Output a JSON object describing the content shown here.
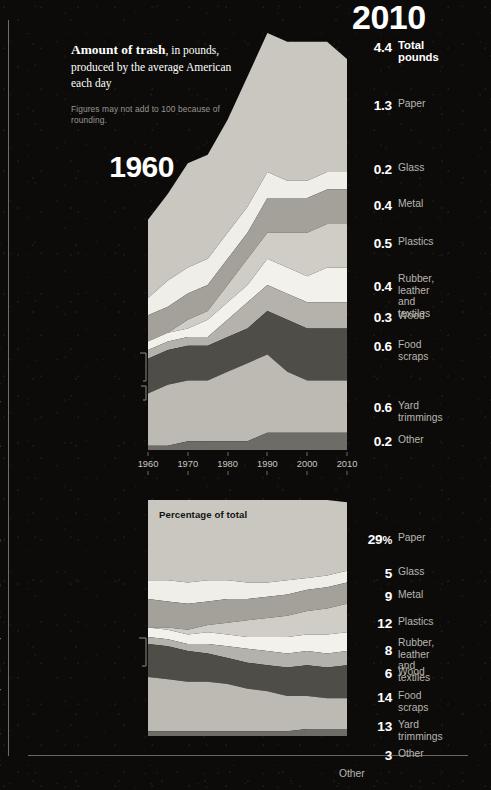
{
  "headline": {
    "bold": "Amount of trash",
    "rest": ", in pounds, produced by the average American each day",
    "note": "Figures may not add to 100 because of rounding."
  },
  "left_title": "1960",
  "right_title": "2010",
  "pct_chart_title": "Percentage of total",
  "footer_label": "Other",
  "colors": {
    "paper": "#c9c7c0",
    "glass": "#efeee8",
    "metal": "#a3a199",
    "plastics": "#cfcdc6",
    "rubber": "#f2f1eb",
    "wood": "#b4b2aa",
    "food_scraps": "#4f4d48",
    "yard_trimmings": "#bcbab2",
    "other": "#6e6c66",
    "background": "#0c0b0a",
    "text_primary": "#ffffff",
    "text_secondary": "#b9b5af"
  },
  "axis": {
    "ticks": [
      "1960",
      "1970",
      "1980",
      "1990",
      "2000",
      "2010"
    ],
    "min": 1960,
    "max": 2010
  },
  "pounds_1960": {
    "header_label": "Total pounds",
    "header_value": "2.7",
    "rows": [
      {
        "label": "Paper",
        "value": "0.9"
      },
      {
        "label": "Glass",
        "value": "0.2"
      },
      {
        "label": "Metal",
        "value": "0.3"
      },
      {
        "label": "Rubber, leather\nand textiles",
        "value": "0.1"
      },
      {
        "label": "Wood",
        "value": "0.1"
      },
      {
        "label": "Food scraps",
        "value": "0.4"
      },
      {
        "label": "Yard trimmings",
        "value": "0.6"
      },
      {
        "label": "Other",
        "value": "<0.1"
      }
    ]
  },
  "pounds_2010": {
    "header_label": "Total pounds",
    "header_value": "4.4",
    "rows": [
      {
        "label": "Paper",
        "value": "1.3"
      },
      {
        "label": "Glass",
        "value": "0.2"
      },
      {
        "label": "Metal",
        "value": "0.4"
      },
      {
        "label": "Plastics",
        "value": "0.5"
      },
      {
        "label": "Rubber, leather\nand textiles",
        "value": "0.4"
      },
      {
        "label": "Wood",
        "value": "0.3"
      },
      {
        "label": "Food scraps",
        "value": "0.6"
      },
      {
        "label": "Yard trimmings",
        "value": "0.6"
      },
      {
        "label": "Other",
        "value": "0.2"
      }
    ]
  },
  "percent_1960": {
    "rows": [
      {
        "label": "Paper",
        "value": "34",
        "unit": "%"
      },
      {
        "label": "Glass",
        "value": "8",
        "unit": ""
      },
      {
        "label": "Metal",
        "value": "12",
        "unit": ""
      },
      {
        "label": "Rubber, leather\nand textiles",
        "value": "4",
        "unit": ""
      },
      {
        "label": "Wood",
        "value": "3",
        "unit": ""
      },
      {
        "label": "Food scraps",
        "value": "14",
        "unit": ""
      },
      {
        "label": "Yard trimmings",
        "value": "23",
        "unit": ""
      },
      {
        "label": "Other",
        "value": "2",
        "unit": ""
      }
    ]
  },
  "percent_2010": {
    "rows": [
      {
        "label": "Paper",
        "value": "29",
        "unit": "%"
      },
      {
        "label": "Glass",
        "value": "5",
        "unit": ""
      },
      {
        "label": "Metal",
        "value": "9",
        "unit": ""
      },
      {
        "label": "Plastics",
        "value": "12",
        "unit": ""
      },
      {
        "label": "Rubber, leather\nand textiles",
        "value": "8",
        "unit": ""
      },
      {
        "label": "Wood",
        "value": "6",
        "unit": ""
      },
      {
        "label": "Food scraps",
        "value": "14",
        "unit": ""
      },
      {
        "label": "Yard trimmings",
        "value": "13",
        "unit": ""
      },
      {
        "label": "Other",
        "value": "3",
        "unit": ""
      }
    ]
  },
  "chart_data": [
    {
      "type": "area",
      "id": "pounds-stacked-area",
      "title": "Amount of trash, in pounds, produced by the average American each day",
      "xlabel": "",
      "ylabel": "pounds per person per day",
      "x": [
        1960,
        1965,
        1970,
        1975,
        1980,
        1985,
        1990,
        1995,
        2000,
        2005,
        2010
      ],
      "xlim": [
        1960,
        2010
      ],
      "ylim": [
        0,
        4.8
      ],
      "grid": false,
      "legend": "outside-left-and-right",
      "stacked": true,
      "series": [
        {
          "name": "Paper",
          "color": "#c9c7c0",
          "values": [
            0.9,
            1.0,
            1.2,
            1.2,
            1.3,
            1.5,
            1.6,
            1.6,
            1.6,
            1.5,
            1.3
          ]
        },
        {
          "name": "Glass",
          "color": "#efeee8",
          "values": [
            0.2,
            0.3,
            0.3,
            0.3,
            0.3,
            0.3,
            0.3,
            0.2,
            0.2,
            0.2,
            0.2
          ]
        },
        {
          "name": "Metal",
          "color": "#a3a199",
          "values": [
            0.3,
            0.3,
            0.3,
            0.3,
            0.3,
            0.3,
            0.4,
            0.4,
            0.4,
            0.4,
            0.4
          ]
        },
        {
          "name": "Plastics",
          "color": "#cfcdc6",
          "values": [
            0.0,
            0.0,
            0.1,
            0.1,
            0.2,
            0.3,
            0.3,
            0.4,
            0.5,
            0.5,
            0.5
          ]
        },
        {
          "name": "Rubber, leather and textiles",
          "color": "#f2f1eb",
          "values": [
            0.1,
            0.1,
            0.1,
            0.2,
            0.2,
            0.2,
            0.3,
            0.3,
            0.3,
            0.4,
            0.4
          ]
        },
        {
          "name": "Wood",
          "color": "#b4b2aa",
          "values": [
            0.1,
            0.1,
            0.1,
            0.1,
            0.2,
            0.3,
            0.3,
            0.3,
            0.3,
            0.3,
            0.3
          ]
        },
        {
          "name": "Food scraps",
          "color": "#4f4d48",
          "values": [
            0.4,
            0.4,
            0.4,
            0.4,
            0.4,
            0.4,
            0.5,
            0.6,
            0.6,
            0.6,
            0.6
          ]
        },
        {
          "name": "Yard trimmings",
          "color": "#bcbab2",
          "values": [
            0.6,
            0.7,
            0.7,
            0.7,
            0.8,
            0.9,
            0.9,
            0.7,
            0.6,
            0.6,
            0.6
          ]
        },
        {
          "name": "Other",
          "color": "#6e6c66",
          "values": [
            0.05,
            0.05,
            0.1,
            0.1,
            0.1,
            0.1,
            0.2,
            0.2,
            0.2,
            0.2,
            0.2
          ]
        }
      ],
      "totals": {
        "1960": 2.7,
        "2010": 4.4
      }
    },
    {
      "type": "area",
      "id": "percentage-stacked-area",
      "title": "Percentage of total",
      "xlabel": "",
      "ylabel": "percent of total",
      "x": [
        1960,
        1965,
        1970,
        1975,
        1980,
        1985,
        1990,
        1995,
        2000,
        2005,
        2010
      ],
      "xlim": [
        1960,
        2010
      ],
      "ylim": [
        0,
        100
      ],
      "grid": false,
      "legend": "outside-left-and-right",
      "stacked": true,
      "series": [
        {
          "name": "Paper",
          "color": "#c9c7c0",
          "values": [
            34,
            34,
            35,
            34,
            34,
            35,
            35,
            34,
            33,
            32,
            29
          ]
        },
        {
          "name": "Glass",
          "color": "#efeee8",
          "values": [
            8,
            9,
            9,
            9,
            8,
            7,
            6,
            6,
            5,
            5,
            5
          ]
        },
        {
          "name": "Metal",
          "color": "#a3a199",
          "values": [
            12,
            11,
            11,
            10,
            10,
            9,
            9,
            9,
            9,
            9,
            9
          ]
        },
        {
          "name": "Plastics",
          "color": "#cfcdc6",
          "values": [
            0,
            1,
            2,
            3,
            5,
            7,
            8,
            9,
            10,
            11,
            12
          ]
        },
        {
          "name": "Rubber, leather and textiles",
          "color": "#f2f1eb",
          "values": [
            4,
            4,
            4,
            5,
            5,
            5,
            6,
            7,
            7,
            8,
            8
          ]
        },
        {
          "name": "Wood",
          "color": "#b4b2aa",
          "values": [
            3,
            3,
            3,
            4,
            5,
            6,
            6,
            6,
            6,
            6,
            6
          ]
        },
        {
          "name": "Food scraps",
          "color": "#4f4d48",
          "values": [
            14,
            14,
            13,
            12,
            11,
            11,
            11,
            12,
            13,
            13,
            14
          ]
        },
        {
          "name": "Yard trimmings",
          "color": "#bcbab2",
          "values": [
            23,
            22,
            21,
            21,
            20,
            18,
            17,
            15,
            14,
            13,
            13
          ]
        },
        {
          "name": "Other",
          "color": "#6e6c66",
          "values": [
            2,
            2,
            2,
            2,
            2,
            2,
            2,
            2,
            3,
            3,
            3
          ]
        }
      ]
    }
  ]
}
